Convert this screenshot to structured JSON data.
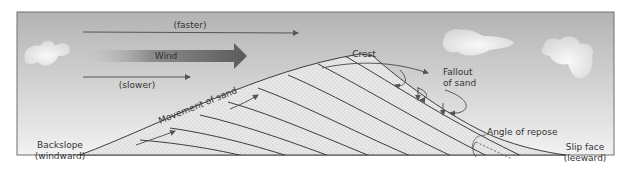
{
  "diagram": {
    "labels": {
      "faster": "(faster)",
      "wind": "Wind",
      "slower": "(slower)",
      "crest": "Crest",
      "fallout_line1": "Fallout",
      "fallout_line2": "of sand",
      "movement": "Movement of sand",
      "angle": "Angle of repose",
      "backslope_line1": "Backslope",
      "backslope_line2": "(windward)",
      "slipface_line1": "Slip face",
      "slipface_line2": "(leeward)"
    },
    "colors": {
      "sky_top": "#b4b4b4",
      "sky_bottom": "#f0f0f0",
      "frame": "#6e6e6e",
      "sand": "#e6e6e6",
      "bedding_line": "#2a2a2a",
      "arrow": "#555555",
      "wind_arrow_dark": "#666666",
      "text": "#333333"
    },
    "icons": [
      "cloud-icon",
      "cloud-icon",
      "cloud-icon",
      "wind-arrow-icon"
    ]
  }
}
